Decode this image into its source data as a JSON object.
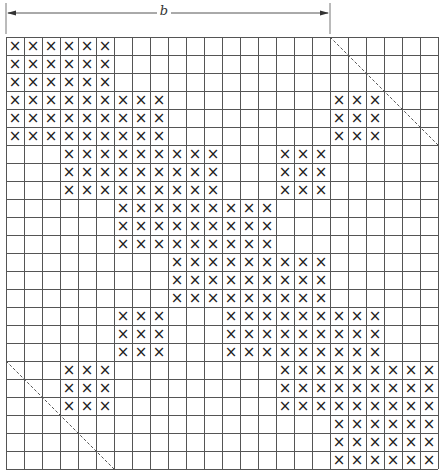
{
  "diagram": {
    "dimension_label": "b",
    "grid_rows": 24,
    "grid_cols": 24,
    "bandwidth_cols": 18,
    "mark_symbol": "×",
    "colors": {
      "line": "#555555",
      "mark": "#222222",
      "dashed": "#555555"
    },
    "filled_blocks": [
      {
        "rows": [
          0,
          2
        ],
        "cols": [
          [
            0,
            5
          ]
        ]
      },
      {
        "rows": [
          3,
          5
        ],
        "cols": [
          [
            0,
            8
          ],
          [
            18,
            20
          ]
        ]
      },
      {
        "rows": [
          6,
          8
        ],
        "cols": [
          [
            3,
            11
          ],
          [
            15,
            17
          ]
        ]
      },
      {
        "rows": [
          9,
          11
        ],
        "cols": [
          [
            6,
            14
          ]
        ]
      },
      {
        "rows": [
          12,
          14
        ],
        "cols": [
          [
            9,
            17
          ]
        ]
      },
      {
        "rows": [
          15,
          17
        ],
        "cols": [
          [
            6,
            8
          ],
          [
            12,
            20
          ]
        ]
      },
      {
        "rows": [
          18,
          20
        ],
        "cols": [
          [
            3,
            5
          ],
          [
            15,
            23
          ]
        ]
      },
      {
        "rows": [
          21,
          23
        ],
        "cols": [
          [
            18,
            23
          ]
        ]
      }
    ],
    "band_limit_lines": [
      {
        "name": "upper-band-limit",
        "from_cell": [
          0,
          18
        ],
        "to_cell": [
          6,
          24
        ]
      },
      {
        "name": "lower-band-limit",
        "from_cell": [
          18,
          0
        ],
        "to_cell": [
          24,
          6
        ]
      }
    ]
  }
}
